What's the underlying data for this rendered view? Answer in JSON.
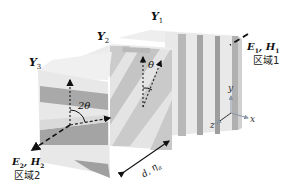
{
  "figure": {
    "type": "3d-grating-stack",
    "slabs": [
      {
        "id": "Y1",
        "label": "Y",
        "sub": "1",
        "grating_orientation": "vertical"
      },
      {
        "id": "Y2",
        "label": "Y",
        "sub": "2",
        "grating_orientation": "diagonal",
        "angle_label": "θ"
      },
      {
        "id": "Y3",
        "label": "Y",
        "sub": "3",
        "grating_orientation": "horizontal",
        "angle_label": "2θ"
      }
    ],
    "input": {
      "field": "E",
      "field_sub": "1",
      "field2": "H",
      "field2_sub": "1",
      "region": "区域1"
    },
    "output": {
      "field": "E",
      "field_sub": "2",
      "field2": "H",
      "field2_sub": "2",
      "region": "区域2"
    },
    "dimension": {
      "label": "d, η",
      "sub": "a"
    },
    "axes": {
      "x": "x",
      "y": "y",
      "z": "z"
    },
    "colors": {
      "slab_light": "#e6e6e6",
      "slab_mid": "#cfcfcf",
      "stripe_dark": "#9a9a9a",
      "stripe_mid": "#b5b5b5",
      "axis_color": "#8a97a8",
      "ink": "#111111"
    }
  }
}
